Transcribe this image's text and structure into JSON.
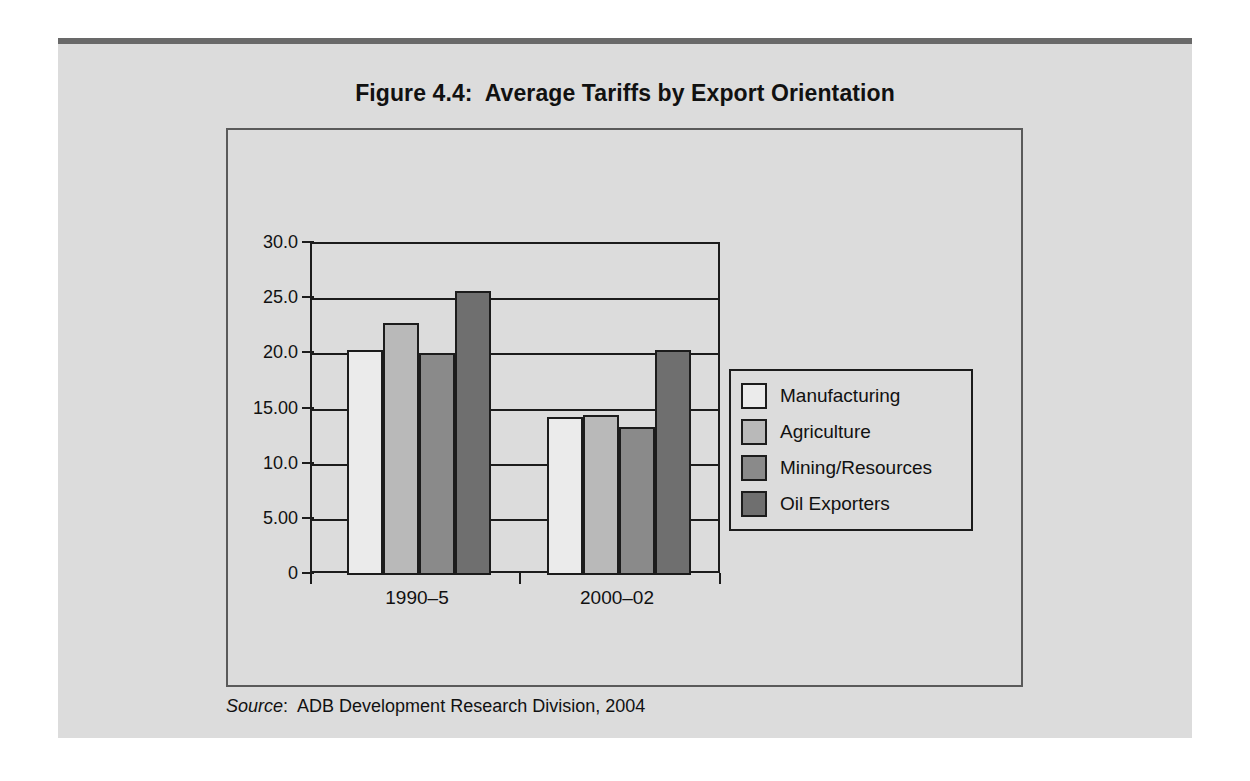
{
  "figure": {
    "title": "Figure 4.4:  Average Tariffs by Export Orientation",
    "source_label": "Source",
    "source_text": ":  ADB Development Research Division, 2004"
  },
  "chart_data": {
    "type": "bar",
    "title": "Figure 4.4:  Average Tariffs by Export Orientation",
    "xlabel": "",
    "ylabel": "",
    "categories": [
      "1990–5",
      "2000–02"
    ],
    "series": [
      {
        "name": "Manufacturing",
        "values": [
          20.4,
          14.3
        ],
        "color": "#ebebeb"
      },
      {
        "name": "Agriculture",
        "values": [
          22.8,
          14.5
        ],
        "color": "#b9b9b9"
      },
      {
        "name": "Mining/Resources",
        "values": [
          20.1,
          13.4
        ],
        "color": "#8a8a8a"
      },
      {
        "name": "Oil Exporters",
        "values": [
          25.7,
          20.4
        ],
        "color": "#6f6f6f"
      }
    ],
    "ylim": [
      0,
      30
    ],
    "ytick_values": [
      30,
      25,
      20,
      15,
      10,
      5,
      0
    ],
    "ytick_labels": [
      "30.0",
      "25.0",
      "20.0",
      "15.00",
      "10.0",
      "5.00",
      "0"
    ],
    "grid": true,
    "legend_position": "right"
  }
}
